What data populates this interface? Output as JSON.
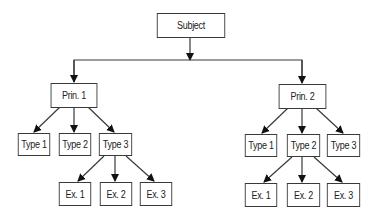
{
  "diagram": {
    "type": "tree",
    "root": {
      "label": "Subject",
      "children": [
        {
          "label": "Prin. 1",
          "children": [
            {
              "label": "Type 1"
            },
            {
              "label": "Type 2"
            },
            {
              "label": "Type 3",
              "children": [
                {
                  "label": "Ex. 1"
                },
                {
                  "label": "Ex. 2"
                },
                {
                  "label": "Ex. 3"
                }
              ]
            }
          ]
        },
        {
          "label": "Prin. 2",
          "children": [
            {
              "label": "Type 1"
            },
            {
              "label": "Type 2",
              "children": [
                {
                  "label": "Ex. 1"
                },
                {
                  "label": "Ex. 2"
                },
                {
                  "label": "Ex. 3"
                }
              ]
            },
            {
              "label": "Type 3"
            }
          ]
        }
      ]
    }
  },
  "nodes": {
    "subject": "Subject",
    "prin1": "Prin. 1",
    "prin2": "Prin. 2",
    "p1_type1": "Type 1",
    "p1_type2": "Type 2",
    "p1_type3": "Type 3",
    "p1_ex1": "Ex. 1",
    "p1_ex2": "Ex. 2",
    "p1_ex3": "Ex. 3",
    "p2_type1": "Type 1",
    "p2_type2": "Type 2",
    "p2_type3": "Type 3",
    "p2_ex1": "Ex. 1",
    "p2_ex2": "Ex. 2",
    "p2_ex3": "Ex. 3"
  },
  "colors": {
    "line": "#3a3a3a",
    "border": "#3a3a3a",
    "background": "#ffffff"
  }
}
